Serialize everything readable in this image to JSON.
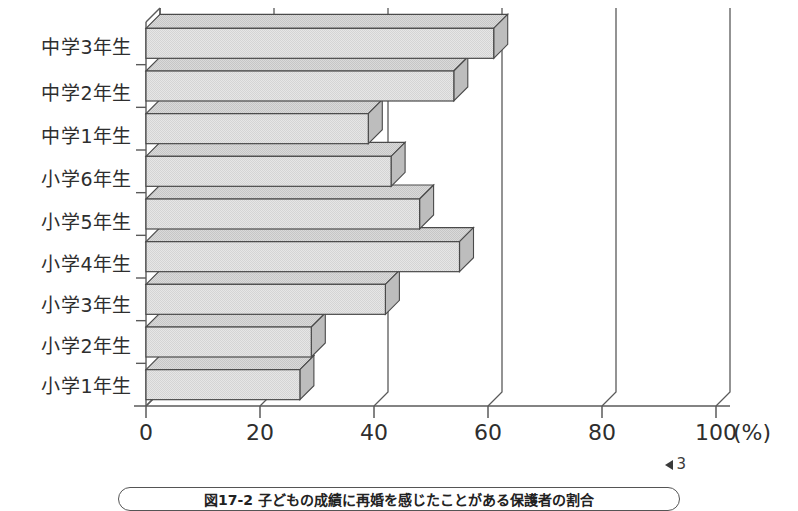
{
  "figure": {
    "page_marker": "3",
    "page_marker_icon": "left-triangle-icon",
    "caption": "図17-2 子どもの成績に再婚を感じたことがある保護者の割合"
  },
  "axis": {
    "x_ticks": [
      "0",
      "20",
      "40",
      "60",
      "80",
      "100"
    ],
    "x_unit": "(%)",
    "x_min": 0,
    "x_max": 100
  },
  "chart_data": {
    "type": "bar",
    "orientation": "horizontal",
    "title": "図17-2 子どもの成績に再婚を感じたことがある保護者の割合",
    "xlabel": "(%)",
    "ylabel": "",
    "xlim": [
      0,
      100
    ],
    "grid": true,
    "legend": "none",
    "style": "3d-horizontal-bar",
    "categories": [
      "中学3年生",
      "中学2年生",
      "中学1年生",
      "小学6年生",
      "小学5年生",
      "小学4年生",
      "小学3年生",
      "小学2年生",
      "小学1年生"
    ],
    "values": [
      61,
      54,
      39,
      43,
      48,
      55,
      42,
      29,
      27
    ],
    "tick_labels": [
      "0",
      "20",
      "40",
      "60",
      "80",
      "100"
    ],
    "tick_values": [
      0,
      20,
      40,
      60,
      80,
      100
    ]
  },
  "colors": {
    "bar_fill": "#e3e3e3",
    "bar_top": "#d2d2d2",
    "bar_side": "#bdbdbd",
    "outline": "#4a4a4a",
    "axis": "#5a5a5a",
    "text": "#2e2e2e",
    "background": "#ffffff"
  }
}
